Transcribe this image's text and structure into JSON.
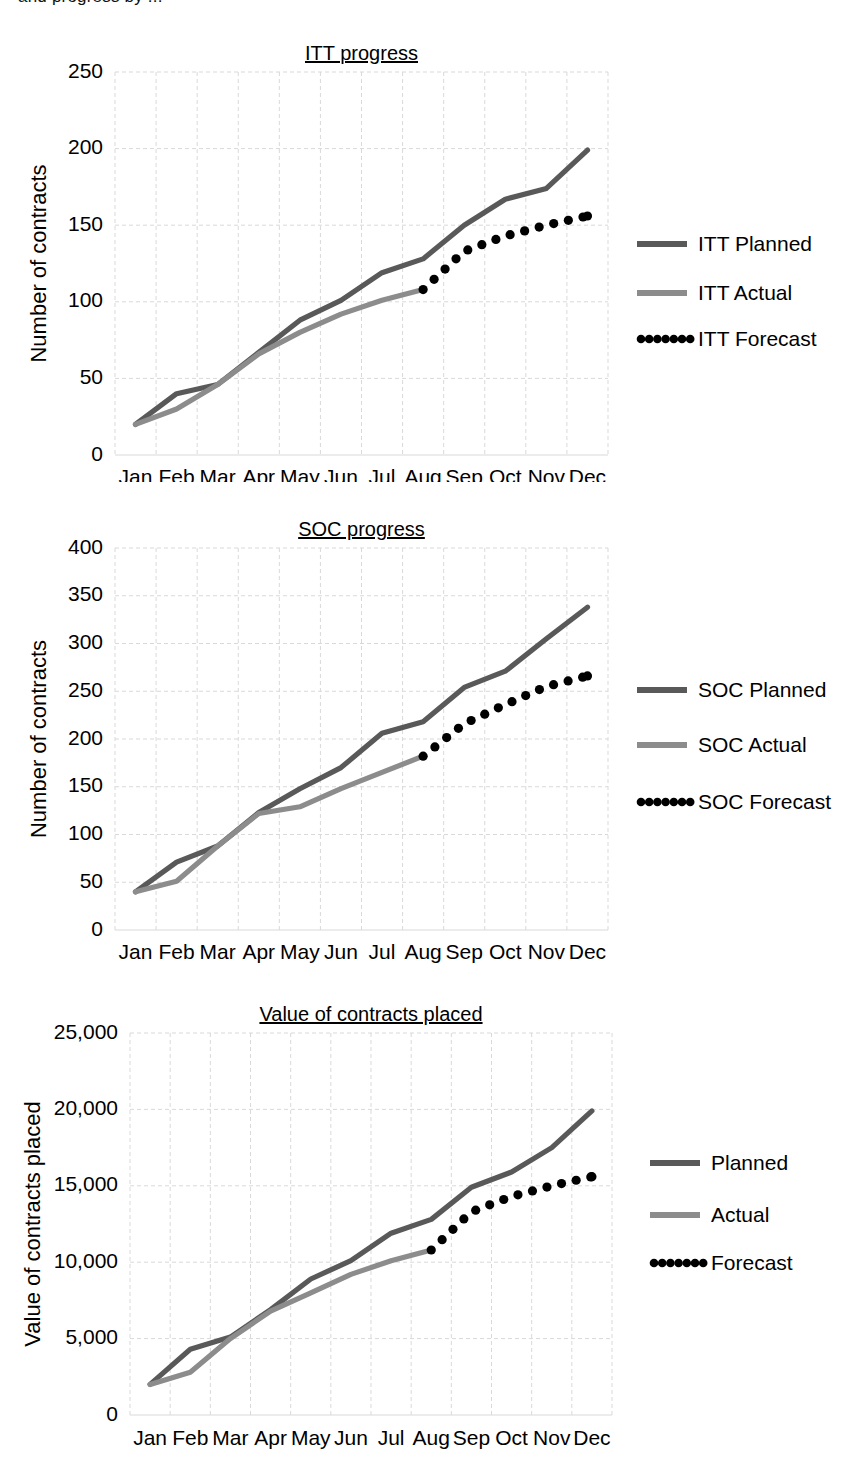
{
  "page": {
    "clipped_header_text": "and progress by ..."
  },
  "axis": {
    "months": [
      "Jan",
      "Feb",
      "Mar",
      "Apr",
      "May",
      "Jun",
      "Jul",
      "Aug",
      "Sep",
      "Oct",
      "Nov",
      "Dec"
    ]
  },
  "colors": {
    "planned": "#595959",
    "actual": "#8c8c8c",
    "forecast": "#000000",
    "grid": "#d9d9d9",
    "background": "#ffffff"
  },
  "charts": [
    {
      "id": "itt-progress",
      "title": "ITT progress",
      "ylabel": "Number of contracts",
      "xlabel": "",
      "yticks": [
        0,
        50,
        100,
        150,
        200,
        250
      ],
      "ytick_labels": [
        "0",
        "50",
        "100",
        "150",
        "200",
        "250"
      ],
      "ylim": [
        0,
        250
      ],
      "legend": [
        {
          "label": "ITT Planned",
          "style": "solid",
          "color": "#595959"
        },
        {
          "label": "ITT Actual",
          "style": "solid",
          "color": "#8c8c8c"
        },
        {
          "label": "ITT Forecast",
          "style": "dotted",
          "color": "#000000"
        }
      ]
    },
    {
      "id": "soc-progress",
      "title": "SOC progress",
      "ylabel": "Number of contracts",
      "xlabel": "",
      "yticks": [
        0,
        50,
        100,
        150,
        200,
        250,
        300,
        350,
        400
      ],
      "ytick_labels": [
        "0",
        "50",
        "100",
        "150",
        "200",
        "250",
        "300",
        "350",
        "400"
      ],
      "ylim": [
        0,
        400
      ],
      "legend": [
        {
          "label": "SOC Planned",
          "style": "solid",
          "color": "#595959"
        },
        {
          "label": "SOC Actual",
          "style": "solid",
          "color": "#8c8c8c"
        },
        {
          "label": "SOC Forecast",
          "style": "dotted",
          "color": "#000000"
        }
      ]
    },
    {
      "id": "value-of-contracts-placed",
      "title": "Value of contracts placed",
      "ylabel": "Value of contracts placed",
      "xlabel": "",
      "yticks": [
        0,
        5000,
        10000,
        15000,
        20000,
        25000
      ],
      "ytick_labels": [
        "0",
        "5,000",
        "10,000",
        "15,000",
        "20,000",
        "25,000"
      ],
      "ylim": [
        0,
        25000
      ],
      "legend": [
        {
          "label": "Planned",
          "style": "solid",
          "color": "#595959"
        },
        {
          "label": "Actual",
          "style": "solid",
          "color": "#8c8c8c"
        },
        {
          "label": "Forecast",
          "style": "dotted",
          "color": "#000000"
        }
      ]
    }
  ],
  "chart_data": [
    {
      "type": "line",
      "title": "ITT progress",
      "xlabel": "",
      "ylabel": "Number of contracts",
      "ylim": [
        0,
        250
      ],
      "grid": true,
      "legend_position": "right",
      "categories": [
        "Jan",
        "Feb",
        "Mar",
        "Apr",
        "May",
        "Jun",
        "Jul",
        "Aug",
        "Sep",
        "Oct",
        "Nov",
        "Dec"
      ],
      "series": [
        {
          "name": "ITT Planned",
          "style": "solid",
          "color": "#595959",
          "values": [
            20,
            40,
            46,
            67,
            88,
            101,
            119,
            128,
            150,
            167,
            174,
            199
          ]
        },
        {
          "name": "ITT Actual",
          "style": "solid",
          "color": "#8c8c8c",
          "values": [
            20,
            30,
            46,
            66,
            80,
            92,
            101,
            108,
            null,
            null,
            null,
            null
          ]
        },
        {
          "name": "ITT Forecast",
          "style": "dotted",
          "color": "#000000",
          "values": [
            null,
            null,
            null,
            null,
            null,
            null,
            null,
            108,
            133,
            143,
            150,
            156
          ]
        }
      ]
    },
    {
      "type": "line",
      "title": "SOC progress",
      "xlabel": "",
      "ylabel": "Number of contracts",
      "ylim": [
        0,
        400
      ],
      "grid": true,
      "legend_position": "right",
      "categories": [
        "Jan",
        "Feb",
        "Mar",
        "Apr",
        "May",
        "Jun",
        "Jul",
        "Aug",
        "Sep",
        "Oct",
        "Nov",
        "Dec"
      ],
      "series": [
        {
          "name": "SOC Planned",
          "style": "solid",
          "color": "#595959",
          "values": [
            40,
            71,
            88,
            123,
            148,
            170,
            206,
            218,
            254,
            271,
            305,
            338
          ]
        },
        {
          "name": "SOC Actual",
          "style": "solid",
          "color": "#8c8c8c",
          "values": [
            40,
            51,
            88,
            122,
            129,
            148,
            165,
            182,
            null,
            null,
            null,
            null
          ]
        },
        {
          "name": "SOC Forecast",
          "style": "dotted",
          "color": "#000000",
          "values": [
            null,
            null,
            null,
            null,
            null,
            null,
            null,
            182,
            216,
            236,
            255,
            266
          ]
        }
      ]
    },
    {
      "type": "line",
      "title": "Value of contracts placed",
      "xlabel": "",
      "ylabel": "Value of contracts placed",
      "ylim": [
        0,
        25000
      ],
      "grid": true,
      "legend_position": "right",
      "categories": [
        "Jan",
        "Feb",
        "Mar",
        "Apr",
        "May",
        "Jun",
        "Jul",
        "Aug",
        "Sep",
        "Oct",
        "Nov",
        "Dec"
      ],
      "series": [
        {
          "name": "Planned",
          "style": "solid",
          "color": "#595959",
          "values": [
            2000,
            4300,
            5100,
            6900,
            8900,
            10100,
            11900,
            12800,
            14900,
            15900,
            17500,
            19900
          ]
        },
        {
          "name": "Actual",
          "style": "solid",
          "color": "#8c8c8c",
          "values": [
            2000,
            2800,
            5000,
            6800,
            8000,
            9200,
            10100,
            10800,
            null,
            null,
            null,
            null
          ]
        },
        {
          "name": "Forecast",
          "style": "dotted",
          "color": "#000000",
          "values": [
            null,
            null,
            null,
            null,
            null,
            null,
            null,
            10800,
            13300,
            14300,
            15000,
            15600
          ]
        }
      ]
    }
  ]
}
